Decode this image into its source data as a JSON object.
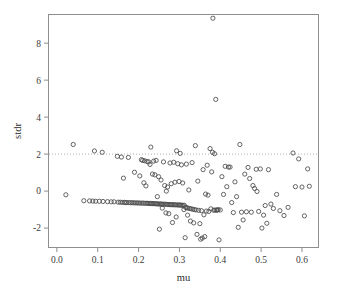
{
  "chart_data": {
    "type": "scatter",
    "title": "",
    "subtitle": "",
    "xlabel": "mu",
    "ylabel": "stdr",
    "xlim": [
      -0.0205,
      0.6405
    ],
    "ylim": [
      -3.05,
      9.55
    ],
    "xticks": [
      0.0,
      0.1,
      0.2,
      0.3,
      0.4,
      0.5,
      0.6
    ],
    "xtick_labels": [
      "0.0",
      "0.1",
      "0.2",
      "0.3",
      "0.4",
      "0.5",
      "0.6"
    ],
    "yticks": [
      -2,
      0,
      2,
      4,
      6,
      8
    ],
    "ytick_labels": [
      "-2",
      "0",
      "2",
      "4",
      "6",
      "8"
    ],
    "grid": false,
    "legend": "none",
    "marker": "open-circle",
    "marker_color": "#4a4a4a",
    "frame_color": "#8e8e8e",
    "annotations": [
      {
        "name": "reference-line",
        "type": "hline",
        "y": 2.0,
        "style": "dotted",
        "color": "#9a9a9a"
      }
    ],
    "n_points": 196,
    "points": [
      [
        0.022,
        -0.2
      ],
      [
        0.04,
        2.52
      ],
      [
        0.066,
        -0.52
      ],
      [
        0.08,
        -0.53
      ],
      [
        0.088,
        -0.54
      ],
      [
        0.092,
        2.17
      ],
      [
        0.095,
        -0.55
      ],
      [
        0.104,
        -0.55
      ],
      [
        0.111,
        2.1
      ],
      [
        0.113,
        -0.56
      ],
      [
        0.124,
        -0.57
      ],
      [
        0.133,
        -0.58
      ],
      [
        0.14,
        -0.58
      ],
      [
        0.148,
        1.88
      ],
      [
        0.15,
        -0.6
      ],
      [
        0.155,
        -0.6
      ],
      [
        0.158,
        1.84
      ],
      [
        0.16,
        -0.61
      ],
      [
        0.163,
        0.7
      ],
      [
        0.165,
        -0.61
      ],
      [
        0.168,
        -0.62
      ],
      [
        0.171,
        -0.62
      ],
      [
        0.175,
        1.82
      ],
      [
        0.176,
        -0.62
      ],
      [
        0.18,
        -0.63
      ],
      [
        0.184,
        -0.63
      ],
      [
        0.188,
        -0.63
      ],
      [
        0.19,
        1.02
      ],
      [
        0.192,
        -0.64
      ],
      [
        0.196,
        -0.64
      ],
      [
        0.2,
        -0.64
      ],
      [
        0.203,
        0.82
      ],
      [
        0.204,
        -0.65
      ],
      [
        0.207,
        1.7
      ],
      [
        0.208,
        -0.65
      ],
      [
        0.21,
        1.66
      ],
      [
        0.212,
        -0.65
      ],
      [
        0.213,
        0.45
      ],
      [
        0.215,
        1.64
      ],
      [
        0.216,
        -0.66
      ],
      [
        0.218,
        0.28
      ],
      [
        0.22,
        -0.66
      ],
      [
        0.221,
        1.6
      ],
      [
        0.223,
        -0.66
      ],
      [
        0.225,
        1.58
      ],
      [
        0.226,
        -0.67
      ],
      [
        0.228,
        1.44
      ],
      [
        0.229,
        -0.67
      ],
      [
        0.23,
        2.38
      ],
      [
        0.232,
        -0.67
      ],
      [
        0.234,
        0.92
      ],
      [
        0.235,
        -0.68
      ],
      [
        0.237,
        1.62
      ],
      [
        0.238,
        -0.68
      ],
      [
        0.24,
        0.88
      ],
      [
        0.241,
        -0.68
      ],
      [
        0.243,
        1.66
      ],
      [
        0.244,
        -0.69
      ],
      [
        0.246,
        -0.3
      ],
      [
        0.247,
        -0.69
      ],
      [
        0.249,
        0.78
      ],
      [
        0.25,
        -0.7
      ],
      [
        0.251,
        -2.06
      ],
      [
        0.253,
        -0.7
      ],
      [
        0.255,
        0.6
      ],
      [
        0.256,
        -0.7
      ],
      [
        0.258,
        -0.92
      ],
      [
        0.259,
        -0.71
      ],
      [
        0.261,
        1.58
      ],
      [
        0.262,
        -0.71
      ],
      [
        0.264,
        0.3
      ],
      [
        0.265,
        -0.71
      ],
      [
        0.267,
        -1.18
      ],
      [
        0.268,
        0.0
      ],
      [
        0.269,
        -0.72
      ],
      [
        0.271,
        0.22
      ],
      [
        0.272,
        -0.72
      ],
      [
        0.274,
        -1.22
      ],
      [
        0.275,
        -0.73
      ],
      [
        0.277,
        1.52
      ],
      [
        0.278,
        -0.73
      ],
      [
        0.28,
        0.4
      ],
      [
        0.281,
        -0.73
      ],
      [
        0.283,
        -1.7
      ],
      [
        0.284,
        -0.74
      ],
      [
        0.286,
        1.56
      ],
      [
        0.287,
        -0.74
      ],
      [
        0.289,
        0.48
      ],
      [
        0.29,
        -0.74
      ],
      [
        0.292,
        -1.4
      ],
      [
        0.293,
        2.18
      ],
      [
        0.294,
        -0.75
      ],
      [
        0.296,
        1.48
      ],
      [
        0.297,
        -0.75
      ],
      [
        0.299,
        0.52
      ],
      [
        0.3,
        -0.75
      ],
      [
        0.302,
        2.04
      ],
      [
        0.303,
        -0.76
      ],
      [
        0.305,
        1.42
      ],
      [
        0.306,
        -0.76
      ],
      [
        0.308,
        0.44
      ],
      [
        0.309,
        -0.77
      ],
      [
        0.311,
        -1.0
      ],
      [
        0.312,
        -0.77
      ],
      [
        0.314,
        -2.52
      ],
      [
        0.315,
        -0.88
      ],
      [
        0.317,
        1.46
      ],
      [
        0.318,
        -0.9
      ],
      [
        0.32,
        -1.3
      ],
      [
        0.321,
        -0.92
      ],
      [
        0.323,
        0.06
      ],
      [
        0.325,
        -0.94
      ],
      [
        0.327,
        -1.62
      ],
      [
        0.329,
        -0.96
      ],
      [
        0.331,
        1.54
      ],
      [
        0.333,
        -0.98
      ],
      [
        0.335,
        -1.72
      ],
      [
        0.337,
        -1.0
      ],
      [
        0.339,
        2.46
      ],
      [
        0.341,
        -1.02
      ],
      [
        0.343,
        -2.34
      ],
      [
        0.345,
        0.54
      ],
      [
        0.347,
        -1.04
      ],
      [
        0.35,
        -1.76
      ],
      [
        0.352,
        -2.6
      ],
      [
        0.354,
        -1.06
      ],
      [
        0.356,
        -2.54
      ],
      [
        0.358,
        1.16
      ],
      [
        0.36,
        -1.28
      ],
      [
        0.362,
        -2.46
      ],
      [
        0.364,
        -0.16
      ],
      [
        0.366,
        -1.08
      ],
      [
        0.368,
        1.4
      ],
      [
        0.37,
        -0.22
      ],
      [
        0.372,
        -1.1
      ],
      [
        0.375,
        2.3
      ],
      [
        0.377,
        -0.96
      ],
      [
        0.379,
        1.04
      ],
      [
        0.381,
        2.1
      ],
      [
        0.382,
        9.35
      ],
      [
        0.384,
        -1.04
      ],
      [
        0.386,
        2.02
      ],
      [
        0.387,
        -1.02
      ],
      [
        0.389,
        4.96
      ],
      [
        0.391,
        -1.04
      ],
      [
        0.393,
        -1.02
      ],
      [
        0.395,
        -1.0
      ],
      [
        0.397,
        -2.64
      ],
      [
        0.4,
        -1.02
      ],
      [
        0.404,
        0.78
      ],
      [
        0.408,
        -0.18
      ],
      [
        0.412,
        1.34
      ],
      [
        0.416,
        0.24
      ],
      [
        0.42,
        1.3
      ],
      [
        0.424,
        1.3
      ],
      [
        0.428,
        -0.62
      ],
      [
        0.432,
        -1.16
      ],
      [
        0.436,
        0.5
      ],
      [
        0.44,
        -0.3
      ],
      [
        0.444,
        -1.96
      ],
      [
        0.448,
        2.52
      ],
      [
        0.452,
        -1.14
      ],
      [
        0.456,
        -1.56
      ],
      [
        0.46,
        0.92
      ],
      [
        0.464,
        -1.12
      ],
      [
        0.468,
        1.28
      ],
      [
        0.472,
        0.68
      ],
      [
        0.476,
        -1.14
      ],
      [
        0.48,
        0.3
      ],
      [
        0.484,
        0.14
      ],
      [
        0.488,
        1.18
      ],
      [
        0.49,
        -0.02
      ],
      [
        0.494,
        -1.1
      ],
      [
        0.498,
        1.2
      ],
      [
        0.502,
        -2.0
      ],
      [
        0.506,
        -1.3
      ],
      [
        0.51,
        -0.78
      ],
      [
        0.514,
        -1.74
      ],
      [
        0.518,
        1.16
      ],
      [
        0.524,
        -0.7
      ],
      [
        0.53,
        -0.94
      ],
      [
        0.538,
        -0.18
      ],
      [
        0.546,
        -1.06
      ],
      [
        0.556,
        -1.32
      ],
      [
        0.566,
        -0.88
      ],
      [
        0.578,
        2.06
      ],
      [
        0.584,
        0.24
      ],
      [
        0.592,
        1.74
      ],
      [
        0.6,
        0.22
      ],
      [
        0.606,
        -1.34
      ],
      [
        0.614,
        1.2
      ],
      [
        0.618,
        0.26
      ]
    ]
  }
}
